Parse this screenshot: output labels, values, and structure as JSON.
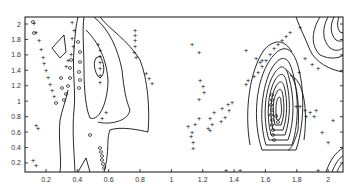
{
  "chart_data": {
    "type": "contour",
    "title": "",
    "xlabel": "",
    "ylabel": "",
    "xlim": [
      0.07,
      2.08
    ],
    "ylim": [
      0.08,
      2.1
    ],
    "grid": false,
    "legend": null,
    "x_ticks": [
      "0.2",
      "0.4",
      "0.6",
      "0.8",
      "1",
      "1.2",
      "1.4",
      "1.6",
      "1.8",
      "2"
    ],
    "x_tick_values": [
      0.2,
      0.4,
      0.6,
      0.8,
      1,
      1.2,
      1.4,
      1.6,
      1.8,
      2
    ],
    "y_ticks": [
      "0.2",
      "0.4",
      "0.6",
      "0.8",
      "1",
      "1.2",
      "1.4",
      "1.6",
      "1.8",
      "2"
    ],
    "y_tick_values": [
      0.2,
      0.4,
      0.6,
      0.8,
      1,
      1.2,
      1.4,
      1.6,
      1.8,
      2
    ],
    "features": [
      {
        "name": "left peak",
        "center": [
          0.53,
          1.3
        ],
        "levels": 3
      },
      {
        "name": "right peak",
        "center": [
          1.72,
          1.05
        ],
        "levels": 12
      },
      {
        "name": "corner peak",
        "center": [
          2.08,
          0.1
        ],
        "levels": 4
      }
    ],
    "markers": {
      "plus": "+",
      "circle": "o"
    }
  }
}
